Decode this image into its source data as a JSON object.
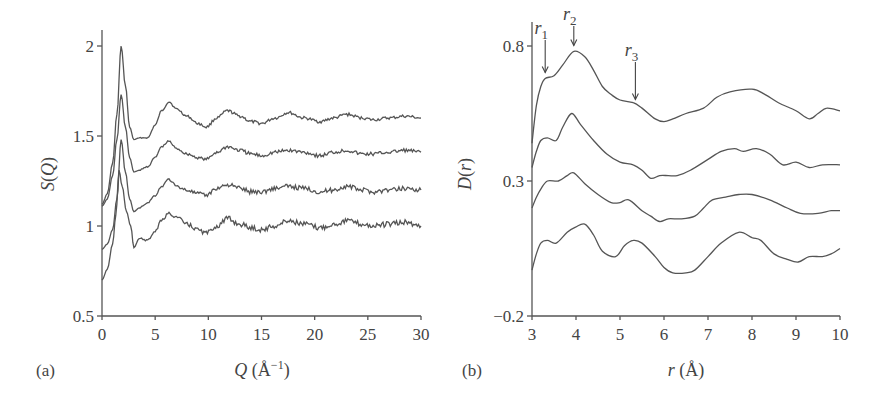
{
  "panels": [
    {
      "id": "a",
      "label": "(a)"
    },
    {
      "id": "b",
      "label": "(b)"
    }
  ],
  "chart_data": [
    {
      "type": "line",
      "panel": "(a)",
      "title": "",
      "xlabel": "Q (Å⁻¹)",
      "ylabel": "S(Q)",
      "xlim": [
        0,
        30
      ],
      "ylim": [
        0.5,
        2.1
      ],
      "xticks": [
        0,
        5,
        10,
        15,
        20,
        25,
        30
      ],
      "yticks": [
        0.5,
        1,
        1.5,
        2
      ],
      "xtick_labels": [
        "0",
        "5",
        "10",
        "15",
        "20",
        "25",
        "30"
      ],
      "ytick_labels": [
        "0.5",
        "1",
        "1.5",
        "2"
      ],
      "grid": false,
      "legend": null,
      "series": [
        {
          "name": "curve 1 (top)",
          "x": [
            0,
            0.5,
            1.0,
            1.4,
            1.8,
            2.2,
            2.6,
            3.0,
            3.5,
            4.3,
            5.0,
            5.6,
            6.3,
            7.0,
            8.0,
            9.0,
            9.8,
            10.8,
            11.8,
            13.0,
            14.0,
            15.0,
            16.3,
            17.5,
            19.0,
            20.5,
            21.8,
            23.0,
            24.5,
            25.5,
            27.0,
            28.5,
            30
          ],
          "y": [
            1.12,
            1.18,
            1.35,
            1.62,
            2.0,
            1.78,
            1.55,
            1.48,
            1.49,
            1.49,
            1.56,
            1.64,
            1.69,
            1.65,
            1.61,
            1.57,
            1.55,
            1.6,
            1.64,
            1.61,
            1.58,
            1.57,
            1.6,
            1.63,
            1.6,
            1.58,
            1.6,
            1.62,
            1.6,
            1.59,
            1.6,
            1.61,
            1.6
          ]
        },
        {
          "name": "curve 2",
          "x": [
            0,
            0.5,
            1.0,
            1.4,
            1.8,
            2.2,
            2.6,
            3.0,
            3.5,
            4.3,
            5.0,
            5.6,
            6.3,
            7.0,
            8.0,
            9.0,
            9.8,
            10.8,
            11.8,
            13.0,
            14.0,
            15.0,
            16.3,
            17.5,
            19.0,
            20.5,
            21.8,
            23.0,
            24.5,
            25.5,
            27.0,
            28.5,
            30
          ],
          "y": [
            1.11,
            1.15,
            1.28,
            1.48,
            1.73,
            1.55,
            1.38,
            1.3,
            1.31,
            1.33,
            1.38,
            1.44,
            1.47,
            1.43,
            1.4,
            1.38,
            1.37,
            1.41,
            1.44,
            1.42,
            1.4,
            1.39,
            1.41,
            1.42,
            1.41,
            1.39,
            1.41,
            1.42,
            1.4,
            1.4,
            1.41,
            1.42,
            1.41
          ]
        },
        {
          "name": "curve 3",
          "x": [
            0,
            0.5,
            1.0,
            1.4,
            1.8,
            2.2,
            2.6,
            3.0,
            3.5,
            4.3,
            5.0,
            5.6,
            6.3,
            7.0,
            8.0,
            9.0,
            9.8,
            10.8,
            11.8,
            13.0,
            14.0,
            15.0,
            16.3,
            17.5,
            19.0,
            20.5,
            21.8,
            23.0,
            24.5,
            25.5,
            27.0,
            28.5,
            30
          ],
          "y": [
            0.87,
            0.9,
            0.98,
            1.15,
            1.48,
            1.3,
            1.15,
            1.08,
            1.1,
            1.13,
            1.17,
            1.22,
            1.26,
            1.22,
            1.2,
            1.18,
            1.17,
            1.21,
            1.23,
            1.21,
            1.19,
            1.19,
            1.21,
            1.22,
            1.21,
            1.19,
            1.2,
            1.22,
            1.2,
            1.19,
            1.2,
            1.21,
            1.2
          ]
        },
        {
          "name": "curve 4 (bottom)",
          "x": [
            0,
            0.5,
            1.0,
            1.3,
            1.6,
            1.9,
            2.3,
            2.7,
            3.0,
            3.5,
            4.3,
            5.0,
            5.6,
            6.3,
            7.0,
            8.0,
            9.0,
            9.8,
            10.8,
            11.8,
            13.0,
            14.0,
            15.0,
            16.3,
            17.5,
            19.0,
            20.5,
            21.8,
            23.0,
            24.5,
            25.5,
            27.0,
            28.5,
            30
          ],
          "y": [
            0.7,
            0.76,
            0.9,
            1.06,
            1.31,
            1.22,
            1.08,
            1.0,
            0.88,
            0.93,
            0.92,
            0.97,
            1.03,
            1.07,
            1.05,
            1.01,
            0.98,
            0.96,
            1.0,
            1.04,
            1.01,
            0.99,
            0.98,
            1.0,
            1.03,
            1.01,
            0.99,
            1.01,
            1.03,
            1.01,
            1.0,
            1.01,
            1.02,
            1.0
          ]
        }
      ]
    },
    {
      "type": "line",
      "panel": "(b)",
      "title": "",
      "xlabel": "r (Å)",
      "ylabel": "D(r)",
      "xlim": [
        3,
        10
      ],
      "ylim": [
        -0.2,
        0.92
      ],
      "xticks": [
        3,
        4,
        5,
        6,
        7,
        8,
        9,
        10
      ],
      "yticks": [
        -0.2,
        0.3,
        0.8
      ],
      "xtick_labels": [
        "3",
        "4",
        "5",
        "6",
        "7",
        "8",
        "9",
        "10"
      ],
      "ytick_labels": [
        "−0.2",
        "0.3",
        "0.8"
      ],
      "grid": false,
      "legend": null,
      "annotations": [
        {
          "text": "r1",
          "sub": "1",
          "x": 3.3,
          "points_to_y": 0.68
        },
        {
          "text": "r2",
          "sub": "2",
          "x": 3.95,
          "points_to_y": 0.78
        },
        {
          "text": "r3",
          "sub": "3",
          "x": 5.35,
          "points_to_y": 0.58
        }
      ],
      "series": [
        {
          "name": "curve 1 (top)",
          "x": [
            3.0,
            3.1,
            3.2,
            3.3,
            3.5,
            3.7,
            3.95,
            4.2,
            4.4,
            4.6,
            4.8,
            5.0,
            5.3,
            5.5,
            5.8,
            6.0,
            6.2,
            6.5,
            6.9,
            7.2,
            7.5,
            8.0,
            8.3,
            8.6,
            9.0,
            9.3,
            9.5,
            9.7,
            10.0
          ],
          "y": [
            0.44,
            0.58,
            0.65,
            0.68,
            0.69,
            0.73,
            0.78,
            0.76,
            0.71,
            0.65,
            0.62,
            0.6,
            0.59,
            0.57,
            0.53,
            0.52,
            0.53,
            0.55,
            0.57,
            0.61,
            0.63,
            0.64,
            0.62,
            0.59,
            0.56,
            0.53,
            0.55,
            0.57,
            0.56
          ]
        },
        {
          "name": "curve 2",
          "x": [
            3.0,
            3.1,
            3.2,
            3.35,
            3.55,
            3.7,
            3.9,
            4.1,
            4.4,
            4.7,
            5.0,
            5.3,
            5.5,
            5.7,
            5.9,
            6.1,
            6.3,
            6.6,
            7.0,
            7.3,
            7.6,
            7.8,
            8.1,
            8.4,
            8.7,
            9.0,
            9.3,
            9.6,
            10.0
          ],
          "y": [
            0.35,
            0.41,
            0.45,
            0.46,
            0.45,
            0.5,
            0.55,
            0.51,
            0.45,
            0.4,
            0.37,
            0.36,
            0.34,
            0.31,
            0.32,
            0.32,
            0.32,
            0.34,
            0.38,
            0.41,
            0.42,
            0.41,
            0.42,
            0.4,
            0.36,
            0.37,
            0.35,
            0.36,
            0.36
          ]
        },
        {
          "name": "curve 3",
          "x": [
            3.0,
            3.1,
            3.2,
            3.35,
            3.6,
            3.8,
            3.95,
            4.2,
            4.5,
            4.8,
            5.0,
            5.2,
            5.5,
            5.7,
            5.9,
            6.1,
            6.4,
            6.7,
            6.9,
            7.1,
            7.4,
            7.7,
            8.0,
            8.4,
            8.8,
            9.1,
            9.5,
            9.8,
            10.0
          ],
          "y": [
            0.2,
            0.24,
            0.27,
            0.3,
            0.3,
            0.32,
            0.33,
            0.29,
            0.25,
            0.22,
            0.22,
            0.23,
            0.19,
            0.17,
            0.15,
            0.16,
            0.16,
            0.17,
            0.2,
            0.23,
            0.24,
            0.25,
            0.25,
            0.23,
            0.2,
            0.18,
            0.18,
            0.19,
            0.19
          ]
        },
        {
          "name": "curve 4 (bottom)",
          "x": [
            3.0,
            3.1,
            3.2,
            3.35,
            3.55,
            3.8,
            4.0,
            4.2,
            4.4,
            4.6,
            4.9,
            5.1,
            5.3,
            5.5,
            5.8,
            6.0,
            6.2,
            6.5,
            6.7,
            7.0,
            7.3,
            7.7,
            8.0,
            8.2,
            8.5,
            8.8,
            9.05,
            9.3,
            9.6,
            9.8,
            10.0
          ],
          "y": [
            -0.03,
            0.03,
            0.07,
            0.08,
            0.07,
            0.11,
            0.13,
            0.14,
            0.1,
            0.04,
            0.02,
            0.06,
            0.08,
            0.07,
            0.02,
            -0.02,
            -0.04,
            -0.04,
            -0.03,
            0.02,
            0.07,
            0.11,
            0.09,
            0.08,
            0.03,
            0.01,
            0.0,
            0.02,
            0.02,
            0.03,
            0.05
          ]
        }
      ]
    }
  ]
}
